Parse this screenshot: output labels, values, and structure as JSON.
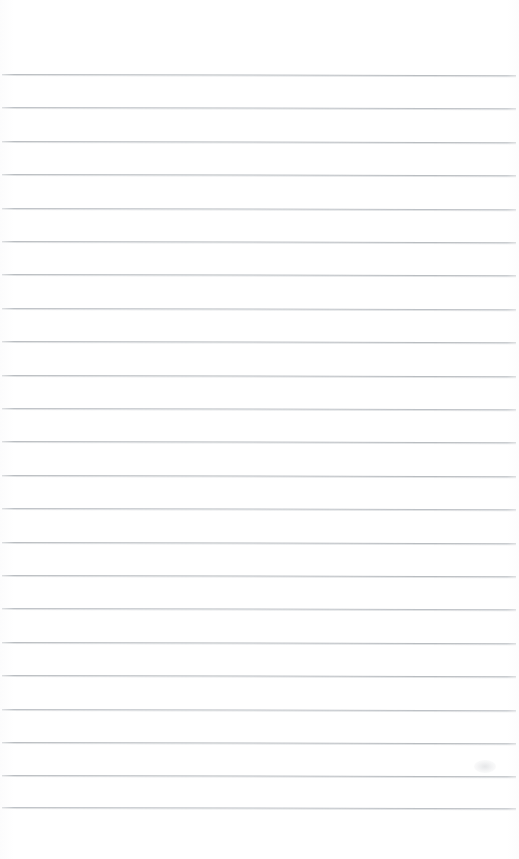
{
  "document": {
    "kind": "scanned-ruled-paper",
    "title": "Ruled Notebook Page",
    "page_width": 519,
    "page_height": 859,
    "background_color": "#ffffff",
    "written_text": "",
    "content_note": "Blank ruled page - no handwriting or printed text present"
  },
  "ruling": {
    "line_color": "#b6babe",
    "line_color_soft": "#babec3",
    "line_thickness_px": 1,
    "line_count": 23,
    "line_spacing_px": 33.4,
    "first_line_y": 74,
    "last_line_y": 807,
    "left_inset_px": 2,
    "right_inset_px": 3,
    "skew_degrees": 0.14,
    "top_margin_px": 73,
    "bottom_margin_px": 52,
    "lines_y": [
      74.0,
      107.4,
      140.8,
      174.2,
      207.6,
      241.0,
      274.4,
      307.8,
      341.2,
      374.6,
      408.0,
      441.4,
      474.8,
      508.2,
      541.6,
      575.0,
      608.4,
      641.8,
      675.2,
      708.6,
      742.0,
      775.4,
      807.0
    ]
  },
  "artifacts": {
    "smudges": [
      {
        "name": "faint-scan-smudge",
        "x": 474,
        "y": 760,
        "w": 22,
        "h": 13
      }
    ]
  }
}
